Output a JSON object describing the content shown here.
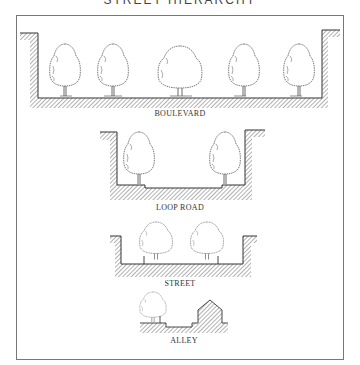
{
  "title": "STREET HIERARCHY",
  "sections": [
    {
      "id": "boulevard",
      "label": "BOULEVARD",
      "tree_count": 5
    },
    {
      "id": "loop-road",
      "label": "LOOP ROAD",
      "tree_count": 2
    },
    {
      "id": "street",
      "label": "STREET",
      "tree_count": 2
    },
    {
      "id": "alley",
      "label": "ALLEY",
      "tree_count": 1,
      "has_house": true
    }
  ],
  "colors": {
    "line": "#333333",
    "hatch": "#555555",
    "frame": "#777777",
    "background": "#ffffff"
  }
}
